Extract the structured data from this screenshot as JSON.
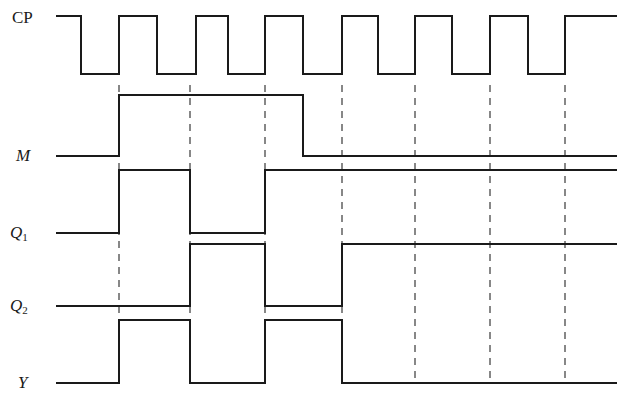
{
  "figure": {
    "type": "digital-timing-diagram",
    "width": 617,
    "height": 413,
    "background_color": "#ffffff",
    "line_color": "#1a1a1a",
    "dash_color": "#555555",
    "line_width": 2
  },
  "labels": {
    "cp": "CP",
    "m": "M",
    "q1_base": "Q",
    "q1_sub": "1",
    "q2_base": "Q",
    "q2_sub": "2",
    "y": "Y"
  },
  "chart_data": {
    "type": "line",
    "title": "",
    "xlabel": "",
    "ylabel": "",
    "grid": false,
    "legend_position": "left-axis-labels",
    "time_unit": "px",
    "x_start": 56,
    "x_end": 617,
    "clock_period_px": 77,
    "dashed_guides_x": [
      119,
      190,
      265,
      342,
      415,
      490,
      565
    ],
    "dashed_guides_y_top": 85,
    "dashed_guides_y_bottom": 383,
    "signals": [
      {
        "name": "CP",
        "label": "CP",
        "level_high_y": 16,
        "level_low_y": 74,
        "start_level": 1,
        "transitions_x": [
          81,
          119,
          157,
          196,
          228,
          265,
          303,
          342,
          378,
          415,
          452,
          490,
          528,
          565
        ],
        "values": [
          1,
          0,
          1,
          0,
          1,
          0,
          1,
          0,
          1,
          0,
          1,
          0,
          1,
          0,
          1
        ],
        "end_level": 1
      },
      {
        "name": "M",
        "label": "M",
        "level_high_y": 95,
        "level_low_y": 156,
        "start_level": 0,
        "transitions_x": [
          119,
          303
        ],
        "values": [
          0,
          1,
          0
        ],
        "end_level": 0
      },
      {
        "name": "Q1",
        "label": "Q1",
        "level_high_y": 170,
        "level_low_y": 233,
        "start_level": 0,
        "transitions_x": [
          119,
          190,
          265
        ],
        "values": [
          0,
          1,
          0,
          1
        ],
        "end_level": 1
      },
      {
        "name": "Q2",
        "label": "Q2",
        "level_high_y": 244,
        "level_low_y": 306,
        "start_level": 0,
        "transitions_x": [
          190,
          265,
          342
        ],
        "values": [
          0,
          1,
          0,
          1
        ],
        "end_level": 1
      },
      {
        "name": "Y",
        "label": "Y",
        "level_high_y": 320,
        "level_low_y": 383,
        "start_level": 0,
        "transitions_x": [
          119,
          190,
          265,
          342
        ],
        "values": [
          0,
          1,
          0,
          1,
          0
        ],
        "end_level": 0
      }
    ]
  },
  "label_positions": {
    "cp": {
      "x": 12,
      "y": 9
    },
    "m": {
      "x": 16,
      "y": 147
    },
    "q1": {
      "x": 10,
      "y": 224
    },
    "q2": {
      "x": 10,
      "y": 297
    },
    "y": {
      "x": 18,
      "y": 374
    }
  }
}
